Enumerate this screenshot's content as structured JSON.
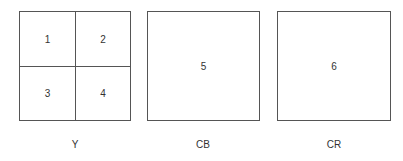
{
  "diagram": {
    "planes": [
      {
        "name": "Y",
        "blocks": [
          "1",
          "2",
          "3",
          "4"
        ],
        "grid": "2x2"
      },
      {
        "name": "CB",
        "blocks": [
          "5"
        ],
        "grid": "1x1"
      },
      {
        "name": "CR",
        "blocks": [
          "6"
        ],
        "grid": "1x1"
      }
    ],
    "colors": {
      "border": "#555555",
      "text": "#333333",
      "background": "#ffffff"
    }
  }
}
